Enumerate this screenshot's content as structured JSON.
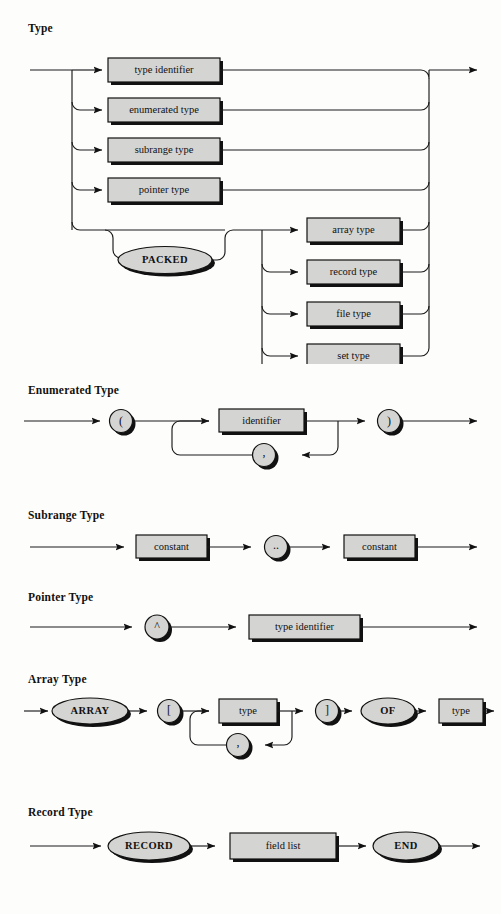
{
  "page": {
    "kind": "railroad-syntax-diagrams",
    "language": "Pascal",
    "background_color": "#fdfdfc",
    "line_color": "#111111",
    "node_fill_color": "#d4d4d2",
    "node_border_color": "#111111",
    "shadow_color": "#111111"
  },
  "diagrams": [
    {
      "id": "type",
      "caption": "Type",
      "nodes": {
        "type_identifier": "type identifier",
        "enumerated_type": "enumerated type",
        "subrange_type": "subrange type",
        "pointer_type": "pointer type",
        "packed": "PACKED",
        "array_type": "array type",
        "record_type": "record type",
        "file_type": "file type",
        "set_type": "set type"
      }
    },
    {
      "id": "enumerated-type",
      "caption": "Enumerated Type",
      "nodes": {
        "lparen": "(",
        "identifier": "identifier",
        "comma": ",",
        "rparen": ")"
      }
    },
    {
      "id": "subrange-type",
      "caption": "Subrange Type",
      "nodes": {
        "constant_lo": "constant",
        "dotdot": "..",
        "constant_hi": "constant"
      }
    },
    {
      "id": "pointer-type",
      "caption": "Pointer Type",
      "nodes": {
        "caret": "^",
        "type_identifier": "type identifier"
      }
    },
    {
      "id": "array-type",
      "caption": "Array Type",
      "nodes": {
        "array": "ARRAY",
        "lbracket": "[",
        "index_type": "type",
        "comma": ",",
        "rbracket": "]",
        "of": "OF",
        "element_type": "type"
      }
    },
    {
      "id": "record-type",
      "caption": "Record Type",
      "nodes": {
        "record": "RECORD",
        "field_list": "field list",
        "end": "END"
      }
    }
  ]
}
